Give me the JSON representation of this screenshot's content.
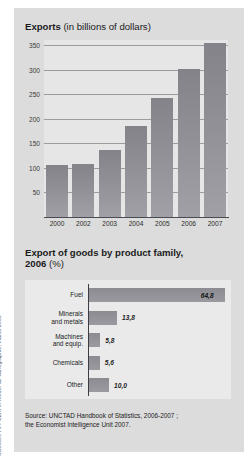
{
  "credit": {
    "text": "Sciences Po / CERI et Atelier de cartographie, march 2008"
  },
  "chart1": {
    "title_bold": "Exports",
    "title_light": " (in billions of dollars)"
  },
  "chart2": {
    "title_bold_line1": "Export of goods by product family,",
    "title_bold_line2": "2006",
    "title_light": " (%)"
  },
  "source": {
    "line1": "Source: UNCTAD Handbook of Statistics, 2006-2007 ;",
    "line2": "the Economist Intelligence Unit 2007."
  },
  "chart_data": [
    {
      "type": "bar",
      "title": "Exports (in billions of dollars)",
      "xlabel": "",
      "ylabel": "",
      "orientation": "vertical",
      "grid": true,
      "legend": "none",
      "ylim": [
        0,
        360
      ],
      "yticks": [
        50,
        100,
        150,
        200,
        250,
        300,
        350
      ],
      "ytick_labels": [
        "50",
        "100",
        "150",
        "200",
        "250",
        "300",
        "350"
      ],
      "categories": [
        "2000",
        "2002",
        "2003",
        "2004",
        "2005",
        "2006",
        "2007"
      ],
      "values": [
        105,
        107,
        137,
        185,
        243,
        302,
        353
      ]
    },
    {
      "type": "bar",
      "title": "Export of goods by product family, 2006 (%)",
      "xlabel": "",
      "ylabel": "",
      "orientation": "horizontal",
      "grid": false,
      "legend": "none",
      "xlim": [
        0,
        70
      ],
      "categories": [
        "Fuel",
        "Minerals and metals",
        "Machines and equip.",
        "Chemicals",
        "Other"
      ],
      "category_lines": [
        [
          "Fuel"
        ],
        [
          "Minerals",
          "and metals"
        ],
        [
          "Machines",
          "and equip."
        ],
        [
          "Chemicals"
        ],
        [
          "Other"
        ]
      ],
      "values": [
        64.8,
        13.8,
        5.8,
        5.6,
        10.0
      ],
      "value_labels": [
        "64,8",
        "13,8",
        "5,8",
        "5,6",
        "10,0"
      ]
    }
  ]
}
